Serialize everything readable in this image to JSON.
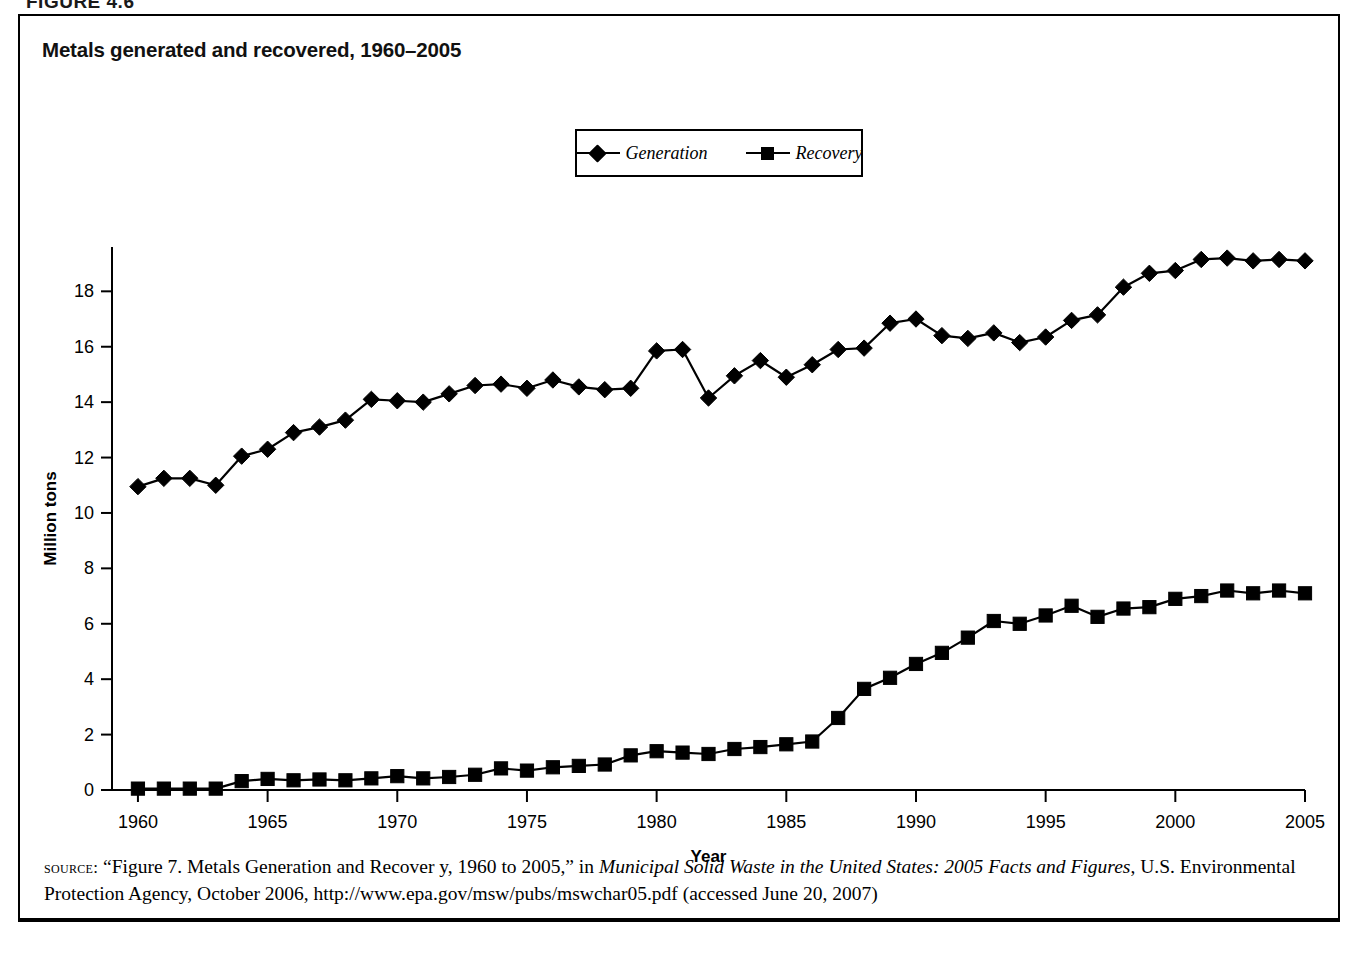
{
  "figure_label": "FIGURE 4.6",
  "chart_title": "Metals generated and recovered, 1960–2005",
  "legend": {
    "position": "top-center",
    "entries": [
      {
        "label": "Generation",
        "marker": "diamond",
        "color": "#000000"
      },
      {
        "label": "Recovery",
        "marker": "square",
        "color": "#000000"
      }
    ]
  },
  "axes": {
    "x_title": "Year",
    "y_title": "Million tons",
    "x_ticks": [
      "1960",
      "1965",
      "1970",
      "1975",
      "1980",
      "1985",
      "1990",
      "1995",
      "2000",
      "2005"
    ],
    "y_ticks": [
      "0",
      "2",
      "4",
      "6",
      "8",
      "10",
      "12",
      "14",
      "16",
      "18"
    ]
  },
  "source": {
    "kicker": "source:",
    "part1": " “Figure 7. Metals Generation and Recover y, 1960 to 2005,” in ",
    "italic1": "Municipal Solid Waste in the United States: 2005 Facts and Figures",
    "part2": ", U.S. Environmental Protection Agency, October 2006, http://www.epa.gov/msw/pubs/mswchar05.pdf (accessed June 20, 2007)"
  },
  "chart_data": {
    "type": "line",
    "title": "Metals generated and recovered, 1960–2005",
    "xlabel": "Year",
    "ylabel": "Million tons",
    "xlim": [
      1959,
      2005
    ],
    "ylim": [
      0,
      19.6
    ],
    "ytick_values": [
      0,
      2,
      4,
      6,
      8,
      10,
      12,
      14,
      16,
      18
    ],
    "xtick_values": [
      1960,
      1965,
      1970,
      1975,
      1980,
      1985,
      1990,
      1995,
      2000,
      2005
    ],
    "grid": false,
    "legend_position": "top-center",
    "x": [
      1960,
      1961,
      1962,
      1963,
      1964,
      1965,
      1966,
      1967,
      1968,
      1969,
      1970,
      1971,
      1972,
      1973,
      1974,
      1975,
      1976,
      1977,
      1978,
      1979,
      1980,
      1981,
      1982,
      1983,
      1984,
      1985,
      1986,
      1987,
      1988,
      1989,
      1990,
      1991,
      1992,
      1993,
      1994,
      1995,
      1996,
      1997,
      1998,
      1999,
      2000,
      2001,
      2002,
      2003,
      2004,
      2005
    ],
    "series": [
      {
        "name": "Generation",
        "marker": "diamond",
        "color": "#000000",
        "values": [
          10.95,
          11.25,
          11.25,
          11.0,
          12.05,
          12.3,
          12.9,
          13.1,
          13.35,
          14.1,
          14.05,
          14.0,
          14.3,
          14.6,
          14.65,
          14.5,
          14.8,
          14.55,
          14.45,
          14.5,
          15.85,
          15.9,
          14.15,
          14.95,
          15.5,
          14.9,
          15.35,
          15.9,
          15.95,
          16.85,
          17.0,
          16.4,
          16.3,
          16.5,
          16.15,
          16.35,
          16.95,
          17.15,
          18.15,
          18.65,
          18.75,
          19.15,
          19.2,
          19.1,
          19.15,
          19.1
        ]
      },
      {
        "name": "Recovery",
        "marker": "square",
        "color": "#000000",
        "values": [
          0.05,
          0.05,
          0.05,
          0.05,
          0.32,
          0.4,
          0.35,
          0.38,
          0.35,
          0.42,
          0.5,
          0.42,
          0.47,
          0.55,
          0.78,
          0.7,
          0.82,
          0.87,
          0.92,
          1.25,
          1.4,
          1.35,
          1.3,
          1.48,
          1.55,
          1.65,
          1.75,
          2.6,
          3.65,
          4.05,
          4.55,
          4.95,
          5.5,
          6.1,
          6.0,
          6.3,
          6.65,
          6.25,
          6.55,
          6.6,
          6.9,
          7.0,
          7.2,
          7.1,
          7.2,
          7.1
        ]
      }
    ]
  }
}
